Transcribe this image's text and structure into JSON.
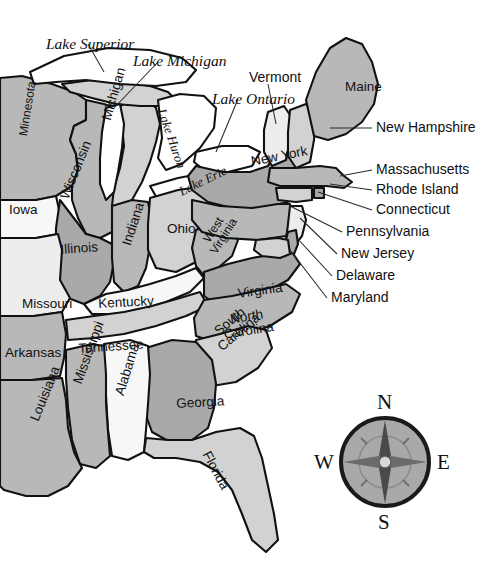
{
  "map": {
    "title": "Eastern United States political map",
    "background_color": "#ffffff",
    "outline_color": "#111111",
    "fills": {
      "dark_gray": "#a9a9a9",
      "mid_gray": "#b8b8b8",
      "light_gray": "#d2d2d2",
      "pale": "#ededed",
      "near_white": "#f7f7f7",
      "lake_white": "#ffffff"
    },
    "states": [
      {
        "name": "Minnesota",
        "fill": "#b8b8b8",
        "label_x": 17,
        "label_y": 135,
        "rotate": -81,
        "size": "small"
      },
      {
        "name": "Wisconsin",
        "fill": "#b8b8b8",
        "label_x": 58,
        "label_y": 196,
        "rotate": -68,
        "size": "state"
      },
      {
        "name": "Michigan",
        "fill": "#d2d2d2",
        "label_x": 100,
        "label_y": 118,
        "rotate": -74,
        "size": "state"
      },
      {
        "name": "Iowa",
        "fill": "#f7f7f7",
        "label_x": 9,
        "label_y": 203,
        "rotate": 0,
        "size": "state"
      },
      {
        "name": "Illinois",
        "fill": "#a9a9a9",
        "label_x": 60,
        "label_y": 243,
        "rotate": -4,
        "size": "state"
      },
      {
        "name": "Indiana",
        "fill": "#b8b8b8",
        "label_x": 120,
        "label_y": 243,
        "rotate": -72,
        "size": "state"
      },
      {
        "name": "Ohio",
        "fill": "#d2d2d2",
        "label_x": 167,
        "label_y": 222,
        "rotate": 0,
        "size": "state"
      },
      {
        "name": "Missouri",
        "fill": "#ededed",
        "label_x": 22,
        "label_y": 297,
        "rotate": 0,
        "size": "state"
      },
      {
        "name": "Kentucky",
        "fill": "#f7f7f7",
        "label_x": 98,
        "label_y": 297,
        "rotate": -3,
        "size": "state"
      },
      {
        "name": "Arkansas",
        "fill": "#b8b8b8",
        "label_x": 5,
        "label_y": 346,
        "rotate": 0,
        "size": "state"
      },
      {
        "name": "Tennessee",
        "fill": "#d2d2d2",
        "label_x": 78,
        "label_y": 342,
        "rotate": -4,
        "size": "state"
      },
      {
        "name": "West Virginia",
        "fill": "#b8b8b8",
        "label_x": 196,
        "label_y": 246,
        "rotate": -58,
        "size": "small"
      },
      {
        "name": "Virginia",
        "fill": "#a9a9a9",
        "label_x": 237,
        "label_y": 287,
        "rotate": -8,
        "size": "state"
      },
      {
        "name": "North Carolina",
        "fill": "#b8b8b8",
        "label_x": 208,
        "label_y": 316,
        "rotate": -9,
        "size": "small"
      },
      {
        "name": "South Carolina",
        "fill": "#d2d2d2",
        "label_x": 197,
        "label_y": 340,
        "rotate": -40,
        "size": "small"
      },
      {
        "name": "Georgia",
        "fill": "#a9a9a9",
        "label_x": 176,
        "label_y": 397,
        "rotate": -3,
        "size": "state"
      },
      {
        "name": "Florida",
        "fill": "#d2d2d2",
        "label_x": 212,
        "label_y": 449,
        "rotate": 62,
        "size": "state"
      },
      {
        "name": "Alabama",
        "fill": "#f7f7f7",
        "label_x": 113,
        "label_y": 393,
        "rotate": -73,
        "size": "state"
      },
      {
        "name": "Mississippi",
        "fill": "#b8b8b8",
        "label_x": 71,
        "label_y": 381,
        "rotate": -70,
        "size": "state"
      },
      {
        "name": "Louisiana",
        "fill": "#b8b8b8",
        "label_x": 28,
        "label_y": 418,
        "rotate": -68,
        "size": "state"
      },
      {
        "name": "New York",
        "fill": "#a9a9a9",
        "label_x": 250,
        "label_y": 155,
        "rotate": -11,
        "size": "state"
      },
      {
        "name": "Maine",
        "fill": "#b8b8b8",
        "label_x": 345,
        "label_y": 80,
        "rotate": 0,
        "size": "state"
      },
      {
        "name": "Vermont",
        "fill": "#ededed",
        "label_x": 249,
        "label_y": 70,
        "rotate": 0,
        "size": "callout"
      },
      {
        "name": "Pennsylvania",
        "fill": "#b8b8b8",
        "label_x": 0,
        "label_y": 0,
        "rotate": 0,
        "size": "callout"
      }
    ],
    "lakes": [
      {
        "name": "Lake Superior",
        "label_x": 46,
        "label_y": 36,
        "rotate": 0,
        "style": "lake"
      },
      {
        "name": "Lake Michigan",
        "label_x": 133,
        "label_y": 53,
        "rotate": 0,
        "style": "lake"
      },
      {
        "name": "Lake Huron",
        "label_x": 168,
        "label_y": 107,
        "rotate": 71,
        "style": "lake-sm"
      },
      {
        "name": "Lake Ontario",
        "label_x": 212,
        "label_y": 91,
        "rotate": 0,
        "style": "lake"
      },
      {
        "name": "Lake Erie",
        "label_x": 177,
        "label_y": 186,
        "rotate": -26,
        "style": "lake-sm"
      }
    ],
    "callouts": [
      {
        "name": "Vermont",
        "label_x": 249,
        "label_y": 70,
        "line": "275,86 272,122"
      },
      {
        "name": "Maine",
        "label_x": 345,
        "label_y": 80,
        "line": ""
      },
      {
        "name": "New Hampshire",
        "label_x": 376,
        "label_y": 120,
        "line": "372,128 333,128"
      },
      {
        "name": "Massachusetts",
        "label_x": 376,
        "label_y": 162,
        "line": "372,170 340,175"
      },
      {
        "name": "Rhode Island",
        "label_x": 376,
        "label_y": 182,
        "line": "372,190 345,183"
      },
      {
        "name": "Connecticut",
        "label_x": 376,
        "label_y": 202,
        "line": "372,210 337,188"
      },
      {
        "name": "Pennsylvania",
        "label_x": 346,
        "label_y": 224,
        "line": "342,232 288,203"
      },
      {
        "name": "New Jersey",
        "label_x": 341,
        "label_y": 246,
        "line": "337,254 300,215"
      },
      {
        "name": "Delaware",
        "label_x": 336,
        "label_y": 268,
        "line": "332,276 298,232"
      },
      {
        "name": "Maryland",
        "label_x": 331,
        "label_y": 290,
        "line": "327,298 292,243"
      }
    ],
    "compass": {
      "center_x": 385,
      "center_y": 462,
      "radius": 44,
      "ring_color": "#1a1a1a",
      "face_color": "#a9a9a9",
      "north": "N",
      "east": "E",
      "south": "S",
      "west": "W"
    }
  }
}
